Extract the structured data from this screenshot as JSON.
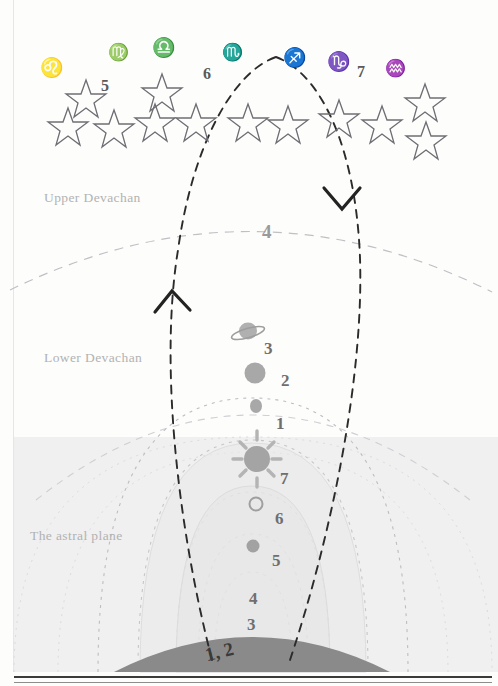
{
  "diagram": {
    "colors": {
      "page_bg": "#fdfdfc",
      "astral_tint": "#f0f0f0",
      "earth_fill": "#8a8a8a",
      "label_gray": "#b2b2b2",
      "path_dark": "#2b2b2b",
      "arc_gray": "#b9b9b9",
      "planet_gray": "#a6a6a6",
      "zodiac_ink": "#4a4a4a"
    },
    "planes": [
      {
        "name": "upper-devachan",
        "label": "Upper Devachan"
      },
      {
        "name": "lower-devachan",
        "label": "Lower Devachan"
      },
      {
        "name": "astral-plane",
        "label": "The astral plane"
      }
    ],
    "zodiac": {
      "signs": [
        {
          "name": "leo",
          "glyph": "♌",
          "label": "Leo",
          "x": 40,
          "y": 58
        },
        {
          "name": "virgo",
          "glyph": "♍",
          "label": "Virgo",
          "x": 108,
          "y": 44
        },
        {
          "name": "libra",
          "glyph": "♎",
          "label": "Libra",
          "x": 152,
          "y": 38
        },
        {
          "name": "scorpio",
          "glyph": "♏",
          "label": "Scorpio",
          "x": 222,
          "y": 44
        },
        {
          "name": "sagittarius",
          "glyph": "♐",
          "label": "Sagittarius",
          "x": 283,
          "y": 48
        },
        {
          "name": "capricorn",
          "glyph": "♑",
          "label": "Capricorn",
          "x": 327,
          "y": 52
        },
        {
          "name": "aquarius",
          "glyph": "♒",
          "label": "Aquarius",
          "x": 385,
          "y": 60
        }
      ],
      "numbers": [
        {
          "name": "zodiac-number-5",
          "value": "5",
          "x": 101,
          "y": 78
        },
        {
          "name": "zodiac-number-6",
          "value": "6",
          "x": 203,
          "y": 66
        },
        {
          "name": "zodiac-number-7",
          "value": "7",
          "x": 357,
          "y": 64
        }
      ],
      "star_count": 16
    },
    "bodies": [
      {
        "name": "saturn",
        "icon": "saturn-icon",
        "number": "3",
        "num_x": 264,
        "num_y": 340
      },
      {
        "name": "jupiter",
        "icon": "filled-disc",
        "number": "2",
        "num_x": 281,
        "num_y": 372
      },
      {
        "name": "mars",
        "icon": "small-disc",
        "number": "1",
        "num_x": 276,
        "num_y": 415
      },
      {
        "name": "sun",
        "icon": "sun-icon",
        "number": "7",
        "num_x": 280,
        "num_y": 470
      },
      {
        "name": "venus",
        "icon": "hollow-circle",
        "number": "6",
        "num_x": 275,
        "num_y": 510
      },
      {
        "name": "mercury",
        "icon": "small-disc",
        "number": "5",
        "num_x": 272,
        "num_y": 552
      },
      {
        "name": "moon",
        "icon": "crescent-icon",
        "number": "4",
        "num_x": 249,
        "num_y": 590
      },
      {
        "name": "earth-3",
        "icon": "none",
        "number": "3",
        "num_x": 247,
        "num_y": 618
      },
      {
        "name": "earth-12",
        "icon": "none",
        "number": "1, 2",
        "num_x": 208,
        "num_y": 644
      }
    ],
    "devachan_number": {
      "name": "upper-devachan-number-4",
      "value": "4",
      "x": 262,
      "y": 222
    },
    "paths": {
      "ascending": {
        "name": "ascending-path",
        "arrow": "arrow-up",
        "arrow_x": 172,
        "arrow_y": 300
      },
      "descending": {
        "name": "descending-path",
        "arrow": "arrow-down",
        "arrow_x": 342,
        "arrow_y": 196
      }
    }
  }
}
